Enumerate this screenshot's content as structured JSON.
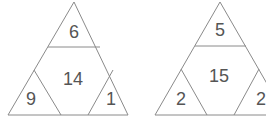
{
  "puzzle": {
    "triangles": [
      {
        "top": "6",
        "center": "14",
        "left": "9",
        "right": "1"
      },
      {
        "top": "5",
        "center": "15",
        "left": "2",
        "right": "2"
      }
    ],
    "colors": {
      "line": "#8a8a8a",
      "text": "#555555",
      "background": "#ffffff"
    }
  }
}
